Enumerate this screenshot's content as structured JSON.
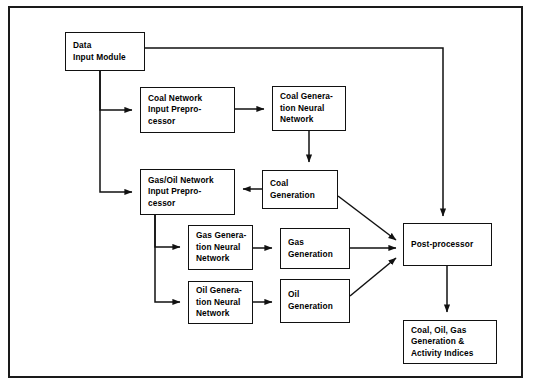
{
  "diagram": {
    "line_color": "#111111",
    "background": "#ffffff",
    "nodes": [
      {
        "id": "data_input",
        "lines": [
          "Data",
          "Input Module"
        ]
      },
      {
        "id": "coal_pre",
        "lines": [
          "Coal Network",
          "Input Prepro-",
          "cessor"
        ]
      },
      {
        "id": "coal_nn",
        "lines": [
          "Coal Genera-",
          "tion Neural",
          "Network"
        ]
      },
      {
        "id": "gasoil_pre",
        "lines": [
          "Gas/Oil Network",
          "Input Prepro-",
          "cessor"
        ]
      },
      {
        "id": "coal_gen",
        "lines": [
          "Coal",
          "Generation"
        ]
      },
      {
        "id": "gas_nn",
        "lines": [
          "Gas Genera-",
          "tion Neural",
          "Network"
        ]
      },
      {
        "id": "gas_gen",
        "lines": [
          "Gas",
          "Generation"
        ]
      },
      {
        "id": "oil_nn",
        "lines": [
          "Oil Genera-",
          "tion Neural",
          "Network"
        ]
      },
      {
        "id": "oil_gen",
        "lines": [
          "Oil",
          "Generation"
        ]
      },
      {
        "id": "post",
        "lines": [
          "Post-processor"
        ]
      },
      {
        "id": "output",
        "lines": [
          "Coal, Oil, Gas",
          "Generation &",
          "Activity Indices"
        ]
      }
    ],
    "edges": [
      {
        "from": "data_input",
        "to": "post",
        "style": "orthogonal-right-down"
      },
      {
        "from": "data_input",
        "to": "coal_pre",
        "style": "orthogonal-down-right"
      },
      {
        "from": "data_input",
        "to": "gasoil_pre",
        "style": "orthogonal-down-right"
      },
      {
        "from": "coal_pre",
        "to": "coal_nn",
        "style": "horizontal"
      },
      {
        "from": "coal_nn",
        "to": "coal_gen",
        "style": "vertical"
      },
      {
        "from": "coal_gen",
        "to": "gasoil_pre",
        "style": "horizontal-left"
      },
      {
        "from": "coal_gen",
        "to": "post",
        "style": "diagonal"
      },
      {
        "from": "gasoil_pre",
        "to": "gas_nn",
        "style": "orthogonal-down-right"
      },
      {
        "from": "gasoil_pre",
        "to": "oil_nn",
        "style": "orthogonal-down-right"
      },
      {
        "from": "gas_nn",
        "to": "gas_gen",
        "style": "horizontal"
      },
      {
        "from": "oil_nn",
        "to": "oil_gen",
        "style": "horizontal"
      },
      {
        "from": "gas_gen",
        "to": "post",
        "style": "horizontal"
      },
      {
        "from": "oil_gen",
        "to": "post",
        "style": "diagonal"
      },
      {
        "from": "post",
        "to": "output",
        "style": "vertical"
      }
    ]
  }
}
